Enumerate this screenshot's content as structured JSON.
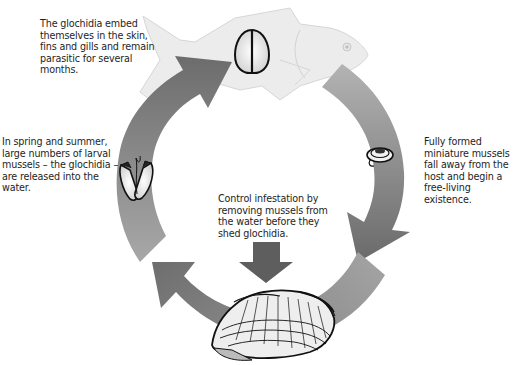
{
  "diagram": {
    "title_cut_off": "",
    "captions": {
      "embed": "The glochidia embed themselves in the skin, fins and gills and remain parasitic for several months.",
      "release": "In spring and summer, large numbers of larval mussels – the glochidia – are released into the water.",
      "fall_away": "Fully formed miniature mussels fall away from the host and begin a free-living existence.",
      "control": "Control infestation by removing mussels from the water before they shed glochidia."
    },
    "stages": [
      {
        "name": "host-fish",
        "icon": "fish-icon"
      },
      {
        "name": "attached-glochidium",
        "icon": "glochidium-closed-icon"
      },
      {
        "name": "juvenile-mussel",
        "icon": "juvenile-mussel-icon"
      },
      {
        "name": "adult-mussel",
        "icon": "adult-mussel-icon"
      },
      {
        "name": "released-glochidium",
        "icon": "glochidium-open-icon"
      }
    ],
    "colors": {
      "arrow_dark": "#6b6b6b",
      "arrow_mid": "#8a8a8a",
      "arrow_light": "#a9a9a9",
      "fish": "#ececec",
      "fish_outline": "#d2d2d2",
      "control_arrow": "#5e5e5e"
    }
  }
}
